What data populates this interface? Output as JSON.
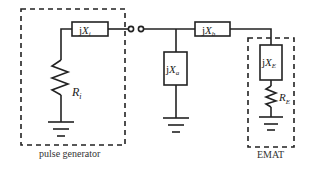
{
  "diagram": {
    "type": "circuit-schematic",
    "components": {
      "Xi": {
        "prefix": "j",
        "symbol": "X",
        "sub": "i"
      },
      "Ri": {
        "symbol": "R",
        "sub": "i"
      },
      "Xb": {
        "prefix": "j",
        "symbol": "X",
        "sub": "b"
      },
      "Xa": {
        "prefix": "j",
        "symbol": "X",
        "sub": "a"
      },
      "XE": {
        "prefix": "j",
        "symbol": "X",
        "sub": "E"
      },
      "RE": {
        "symbol": "R",
        "sub": "E"
      }
    },
    "groups": {
      "pulse_generator": "pulse generator",
      "emat": "EMAT"
    }
  }
}
